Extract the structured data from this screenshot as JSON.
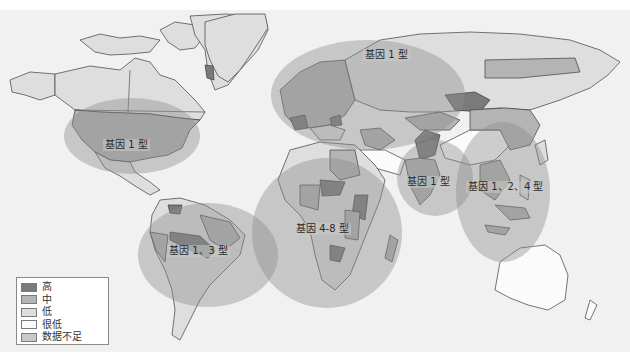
{
  "map": {
    "title": "",
    "colors": {
      "high": "#7a7a7a",
      "medium": "#b4b4b4",
      "low": "#dedede",
      "very_low": "#fbfbfb",
      "no_data": "#c9c9c9",
      "zone_overlay": "#8c8c8c",
      "ocean": "#f1f1f1"
    },
    "zones": [
      {
        "id": "north-america",
        "label": "基因 1 型"
      },
      {
        "id": "south-america",
        "label": "基因 1、3 型"
      },
      {
        "id": "europe-russia",
        "label": "基因 1 型"
      },
      {
        "id": "africa",
        "label": "基因 4-8 型"
      },
      {
        "id": "south-asia",
        "label": "基因 1 型"
      },
      {
        "id": "east-asia",
        "label": "基因 1、2、4 型"
      }
    ]
  },
  "legend": {
    "items": [
      {
        "label": "高",
        "color": "#7a7a7a"
      },
      {
        "label": "中",
        "color": "#b4b4b4"
      },
      {
        "label": "低",
        "color": "#dedede"
      },
      {
        "label": "很低",
        "color": "#fbfbfb"
      },
      {
        "label": "数据不足",
        "color": "#c9c9c9"
      }
    ]
  }
}
